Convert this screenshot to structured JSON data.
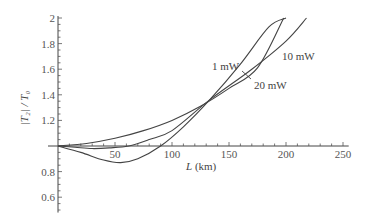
{
  "chart_data": {
    "type": "line",
    "title": "",
    "xlabel": "L (km)",
    "ylabel": "|T2| / T0",
    "xlim": [
      0,
      255
    ],
    "ylim": [
      0.5,
      2.0
    ],
    "axis_origin": {
      "x": 0,
      "y": 1.0
    },
    "grid": false,
    "legend": "inline labels",
    "x_ticks": [
      50,
      100,
      150,
      200,
      250
    ],
    "x_tick_labels": [
      "50",
      "100",
      "150",
      "200",
      "250"
    ],
    "y_ticks": [
      0.6,
      0.8,
      1.2,
      1.4,
      1.6,
      1.8,
      2.0
    ],
    "y_tick_labels": [
      "0.6",
      "0.8",
      "1.2",
      "1.4",
      "1.6",
      "1.8",
      "2"
    ],
    "series": [
      {
        "name": "1 mW",
        "x": [
          0,
          25,
          50,
          75,
          100,
          125,
          150,
          175,
          198
        ],
        "values": [
          1.0,
          1.02,
          1.06,
          1.12,
          1.2,
          1.31,
          1.45,
          1.61,
          2.0
        ]
      },
      {
        "name": "10 mW",
        "x": [
          0,
          15,
          30,
          45,
          62,
          80,
          100,
          133,
          170,
          200,
          218
        ],
        "values": [
          1.0,
          0.99,
          0.98,
          0.985,
          1.0,
          1.05,
          1.12,
          1.36,
          1.6,
          1.82,
          2.0
        ]
      },
      {
        "name": "20 mW",
        "x": [
          0,
          20,
          40,
          55,
          70,
          90,
          110,
          133,
          160,
          185,
          200
        ],
        "values": [
          1.0,
          0.95,
          0.89,
          0.87,
          0.9,
          1.0,
          1.15,
          1.36,
          1.64,
          1.93,
          2.0
        ]
      }
    ],
    "annotations": [
      {
        "text": "1 mW",
        "near_series": "1 mW"
      },
      {
        "text": "10 mW",
        "near_series": "10 mW"
      },
      {
        "text": "20 mW",
        "near_series": "20 mW",
        "leader_line": true
      }
    ]
  },
  "labels": {
    "xlabel_italic": "L",
    "xlabel_unit": " (km)",
    "ylabel_text": "|T₂| / T₀",
    "series_1": "1 mW",
    "series_10": "10 mW",
    "series_20": "20 mW"
  }
}
